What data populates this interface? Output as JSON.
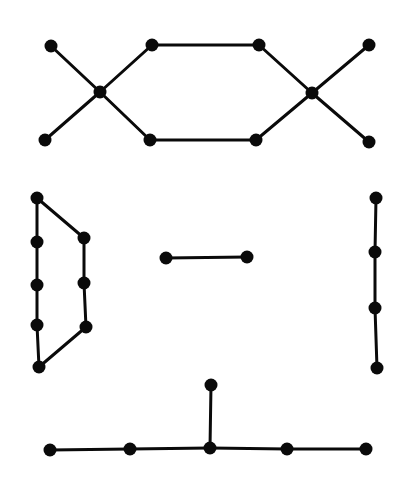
{
  "diagram": {
    "type": "graph-components",
    "width": 407,
    "height": 486,
    "style": {
      "background": "#ffffff",
      "node_color": "#0a0a0a",
      "edge_color": "#0a0a0a",
      "node_radius": 6.5,
      "edge_width": 3
    },
    "components": [
      {
        "id": "double-x-hexagon",
        "nodes": [
          {
            "id": "a1",
            "x": 51,
            "y": 46
          },
          {
            "id": "a2",
            "x": 45,
            "y": 140
          },
          {
            "id": "a3",
            "x": 100,
            "y": 92
          },
          {
            "id": "a4",
            "x": 152,
            "y": 45
          },
          {
            "id": "a5",
            "x": 150,
            "y": 140
          },
          {
            "id": "a6",
            "x": 259,
            "y": 45
          },
          {
            "id": "a7",
            "x": 256,
            "y": 140
          },
          {
            "id": "a8",
            "x": 312,
            "y": 93
          },
          {
            "id": "a9",
            "x": 369,
            "y": 45
          },
          {
            "id": "a10",
            "x": 369,
            "y": 142
          }
        ],
        "edges": [
          [
            "a1",
            "a3"
          ],
          [
            "a2",
            "a3"
          ],
          [
            "a3",
            "a4"
          ],
          [
            "a3",
            "a5"
          ],
          [
            "a4",
            "a6"
          ],
          [
            "a5",
            "a7"
          ],
          [
            "a6",
            "a8"
          ],
          [
            "a7",
            "a8"
          ],
          [
            "a8",
            "a9"
          ],
          [
            "a8",
            "a10"
          ]
        ]
      },
      {
        "id": "cycle-octagon",
        "nodes": [
          {
            "id": "b1",
            "x": 37,
            "y": 198
          },
          {
            "id": "b2",
            "x": 37,
            "y": 242
          },
          {
            "id": "b3",
            "x": 37,
            "y": 285
          },
          {
            "id": "b4",
            "x": 37,
            "y": 325
          },
          {
            "id": "b5",
            "x": 39,
            "y": 367
          },
          {
            "id": "b6",
            "x": 84,
            "y": 238
          },
          {
            "id": "b7",
            "x": 84,
            "y": 283
          },
          {
            "id": "b8",
            "x": 86,
            "y": 327
          }
        ],
        "edges": [
          [
            "b1",
            "b2"
          ],
          [
            "b2",
            "b3"
          ],
          [
            "b3",
            "b4"
          ],
          [
            "b4",
            "b5"
          ],
          [
            "b5",
            "b8"
          ],
          [
            "b8",
            "b7"
          ],
          [
            "b7",
            "b6"
          ],
          [
            "b6",
            "b1"
          ]
        ]
      },
      {
        "id": "single-edge",
        "nodes": [
          {
            "id": "c1",
            "x": 166,
            "y": 258
          },
          {
            "id": "c2",
            "x": 247,
            "y": 257
          }
        ],
        "edges": [
          [
            "c1",
            "c2"
          ]
        ]
      },
      {
        "id": "path-four",
        "nodes": [
          {
            "id": "d1",
            "x": 376,
            "y": 198
          },
          {
            "id": "d2",
            "x": 375,
            "y": 252
          },
          {
            "id": "d3",
            "x": 375,
            "y": 308
          },
          {
            "id": "d4",
            "x": 377,
            "y": 368
          }
        ],
        "edges": [
          [
            "d1",
            "d2"
          ],
          [
            "d2",
            "d3"
          ],
          [
            "d3",
            "d4"
          ]
        ]
      },
      {
        "id": "tree-six",
        "nodes": [
          {
            "id": "e1",
            "x": 211,
            "y": 385
          },
          {
            "id": "e2",
            "x": 50,
            "y": 450
          },
          {
            "id": "e3",
            "x": 130,
            "y": 449
          },
          {
            "id": "e4",
            "x": 210,
            "y": 448
          },
          {
            "id": "e5",
            "x": 287,
            "y": 449
          },
          {
            "id": "e6",
            "x": 366,
            "y": 449
          }
        ],
        "edges": [
          [
            "e2",
            "e3"
          ],
          [
            "e3",
            "e4"
          ],
          [
            "e4",
            "e5"
          ],
          [
            "e5",
            "e6"
          ],
          [
            "e4",
            "e1"
          ]
        ]
      }
    ]
  }
}
